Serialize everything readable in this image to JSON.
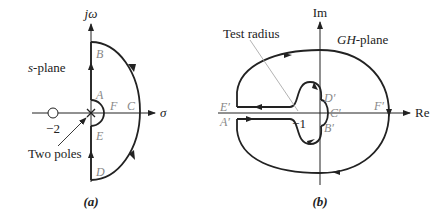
{
  "panel_a": {
    "caption": "(a)",
    "plane_label_italic": "s",
    "plane_label_rest": "-plane",
    "y_axis_label": "jω",
    "x_axis_label": "σ",
    "zero_label": "−2",
    "poles_label": "Two poles",
    "points": {
      "A": "A",
      "B": "B",
      "C": "C",
      "D": "D",
      "E": "E",
      "F": "F"
    }
  },
  "panel_b": {
    "caption": "(b)",
    "plane_label_italic": "GH",
    "plane_label_rest": "-plane",
    "y_axis_label": "Im",
    "x_axis_label": "Re",
    "minus_one_label": "−1",
    "test_radius_label": "Test radius",
    "points": {
      "A": "A′",
      "B": "B′",
      "C": "C′",
      "D": "D′",
      "E": "E′",
      "F": "F′"
    }
  },
  "colors": {
    "line": "#222222",
    "point_label": "#888888",
    "pointer": "#aaaaaa"
  }
}
